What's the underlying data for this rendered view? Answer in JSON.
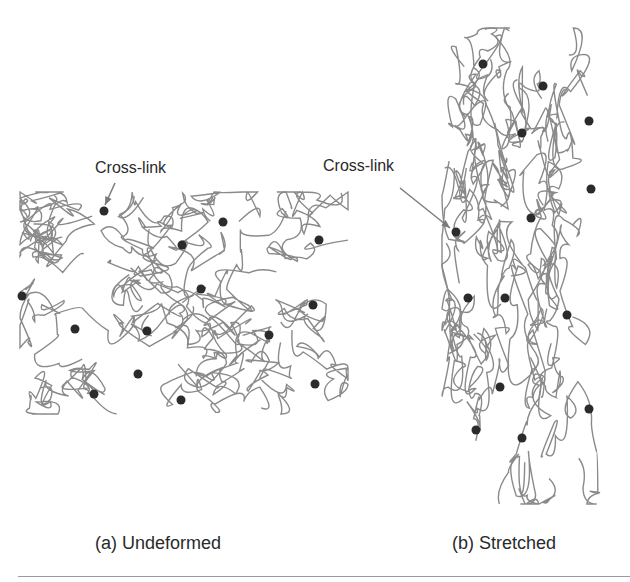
{
  "panels": [
    {
      "id": "a",
      "caption": "(a) Undeformed",
      "annotation": "Cross-link",
      "crosslinks": [
        [
          104,
          211
        ],
        [
          223,
          222
        ],
        [
          182,
          245
        ],
        [
          319,
          240
        ],
        [
          22,
          296
        ],
        [
          201,
          289
        ],
        [
          313,
          305
        ],
        [
          75,
          329
        ],
        [
          147,
          331
        ],
        [
          269,
          335
        ],
        [
          138,
          374
        ],
        [
          315,
          384
        ],
        [
          94,
          394
        ],
        [
          181,
          400
        ]
      ]
    },
    {
      "id": "b",
      "caption": "(b) Stretched",
      "annotation": "Cross-link",
      "crosslinks": [
        [
          483,
          64
        ],
        [
          543,
          86
        ],
        [
          589,
          121
        ],
        [
          522,
          133
        ],
        [
          591,
          189
        ],
        [
          531,
          218
        ],
        [
          456,
          232
        ],
        [
          468,
          298
        ],
        [
          505,
          298
        ],
        [
          567,
          315
        ],
        [
          500,
          387
        ],
        [
          589,
          409
        ],
        [
          476,
          430
        ],
        [
          522,
          438
        ]
      ]
    }
  ],
  "colors": {
    "chain": "#8a8a8a",
    "crosslink": "#2b2b2b",
    "arrow": "#7a7a7a"
  }
}
